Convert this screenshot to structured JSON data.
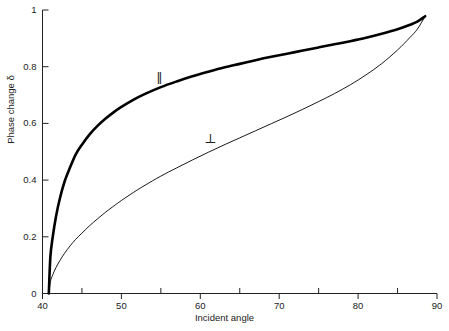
{
  "chart_data": {
    "type": "line",
    "title": "",
    "subtitle": "",
    "xlabel": "Incident angle",
    "ylabel": "Phase change δ",
    "xlim": [
      40,
      90
    ],
    "ylim": [
      0,
      1
    ],
    "grid": false,
    "legend_position": "inline-annotations",
    "x_major_ticks": [
      40,
      50,
      60,
      70,
      80,
      90
    ],
    "x_major_tick_labels": [
      "40",
      "50",
      "60",
      "70",
      "80",
      "90"
    ],
    "x_minor_ticks": [
      45,
      55,
      65,
      75,
      85
    ],
    "y_major_ticks": [
      0,
      0.2,
      0.4,
      0.6,
      0.8,
      1
    ],
    "y_major_tick_labels": [
      "0",
      "0.2",
      "0.4",
      "0.6",
      "0.8",
      "1"
    ],
    "annotations": [
      {
        "text": "∥",
        "name": "parallel-series-annotation",
        "x": 55.0,
        "y": 0.755
      },
      {
        "text": "⊥",
        "name": "perpendicular-series-annotation",
        "x": 61.0,
        "y": 0.545
      }
    ],
    "series": [
      {
        "name": "∥",
        "label": "parallel",
        "color": "#000000",
        "line_width": 2.6,
        "x": [
          40.8,
          41.0,
          41.3,
          41.7,
          42.2,
          42.8,
          43.5,
          44.2,
          45.0,
          46.0,
          47.0,
          48.0,
          49.0,
          50.0,
          51.5,
          53.0,
          55.0,
          57.0,
          59.0,
          61.0,
          63.0,
          65.0,
          67.0,
          69.0,
          71.0,
          73.0,
          75.0,
          77.0,
          79.0,
          81.0,
          83.0,
          85.0,
          86.5,
          87.5,
          88.5
        ],
        "y": [
          0.0,
          0.13,
          0.2,
          0.27,
          0.335,
          0.395,
          0.445,
          0.49,
          0.525,
          0.562,
          0.592,
          0.617,
          0.639,
          0.658,
          0.683,
          0.704,
          0.728,
          0.748,
          0.766,
          0.782,
          0.797,
          0.81,
          0.823,
          0.835,
          0.846,
          0.857,
          0.868,
          0.879,
          0.89,
          0.902,
          0.916,
          0.932,
          0.947,
          0.959,
          0.978
        ]
      },
      {
        "name": "⊥",
        "label": "perpendicular",
        "color": "#000000",
        "line_width": 0.9,
        "x": [
          40.8,
          41.0,
          41.3,
          41.7,
          42.2,
          42.8,
          43.5,
          44.2,
          45.0,
          46.0,
          47.0,
          48.0,
          49.0,
          50.0,
          51.5,
          53.0,
          55.0,
          57.0,
          59.0,
          61.0,
          63.0,
          65.0,
          67.0,
          69.0,
          71.0,
          73.0,
          75.0,
          77.0,
          79.0,
          81.0,
          83.0,
          85.0,
          86.5,
          87.5,
          88.5
        ],
        "y": [
          0.0,
          0.042,
          0.066,
          0.091,
          0.116,
          0.142,
          0.168,
          0.191,
          0.213,
          0.24,
          0.264,
          0.287,
          0.308,
          0.328,
          0.356,
          0.382,
          0.414,
          0.443,
          0.471,
          0.498,
          0.524,
          0.549,
          0.574,
          0.599,
          0.624,
          0.65,
          0.677,
          0.705,
          0.736,
          0.771,
          0.811,
          0.859,
          0.901,
          0.932,
          0.978
        ]
      }
    ]
  },
  "axes": {
    "xlabel": "Incident angle",
    "ylabel": "Phase change δ"
  }
}
